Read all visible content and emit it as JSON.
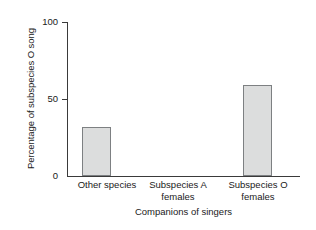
{
  "chart_data": {
    "type": "bar",
    "title": "",
    "xlabel": "Companions of singers",
    "ylabel": "Percentage of subspecies O song",
    "categories": [
      "Other species",
      "Subspecies A females",
      "Subspecies O females"
    ],
    "category_lines": [
      [
        "Other species"
      ],
      [
        "Subspecies A",
        "females"
      ],
      [
        "Subspecies O",
        "females"
      ]
    ],
    "values": [
      32,
      0,
      59
    ],
    "ylim": [
      0,
      100
    ],
    "yticks": [
      0,
      50,
      100
    ],
    "ytick_labels": [
      "0",
      "50",
      "100"
    ],
    "grid": false,
    "legend": false,
    "bar_color": "#dcdddd",
    "bar_edge_color": "#7d8082",
    "axis_color": "#3a3a3a",
    "background": "#ffffff"
  }
}
